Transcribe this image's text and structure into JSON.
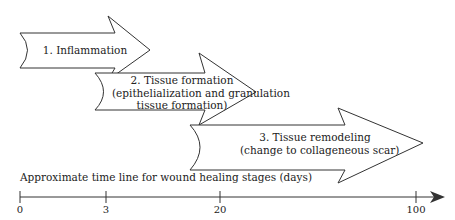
{
  "diagram": {
    "title": "Wound healing stages",
    "stages": [
      {
        "line1": "1. Inflammation",
        "line2": "",
        "line3": ""
      },
      {
        "line1": "2. Tissue formation",
        "line2": "(epithelialization and granulation",
        "line3": "tissue formation)"
      },
      {
        "line1": "3. Tissue remodeling",
        "line2": "(change to collageneous scar)",
        "line3": ""
      }
    ],
    "timeline": {
      "label": "Approximate time line for wound healing stages (days)",
      "ticks": [
        "0",
        "3",
        "20",
        "100"
      ]
    },
    "colors": {
      "stroke": "#333333",
      "fill": "#ffffff",
      "text": "#222222"
    }
  }
}
